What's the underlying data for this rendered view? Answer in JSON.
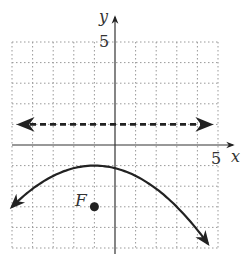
{
  "chart_data": {
    "type": "line",
    "title": "",
    "xlabel": "x",
    "ylabel": "y",
    "xlim": [
      -5,
      5
    ],
    "ylim": [
      -5,
      5
    ],
    "grid": true,
    "x_tick_labels": [
      {
        "value": 5,
        "label": "5"
      }
    ],
    "y_tick_labels": [
      {
        "value": 5,
        "label": "5"
      }
    ],
    "series": [
      {
        "name": "parabola",
        "style": "solid",
        "equation": "y = -(x+1)^2/8 - 1",
        "vertex": [
          -1,
          -1
        ],
        "x": [
          -5,
          -4,
          -3,
          -2,
          -1,
          0,
          1,
          2,
          3,
          4,
          4.5
        ],
        "y": [
          -3,
          -2.125,
          -1.5,
          -1.125,
          -1,
          -1.125,
          -1.5,
          -2.125,
          -3,
          -4.125,
          -4.78
        ]
      },
      {
        "name": "directrix",
        "style": "dashed",
        "equation": "y = 1",
        "x": [
          -5,
          5
        ],
        "y": [
          1,
          1
        ]
      }
    ],
    "points": [
      {
        "label": "F",
        "x": -1,
        "y": -3
      }
    ]
  },
  "labels": {
    "x_axis": "x",
    "y_axis": "y",
    "x_tick": "5",
    "y_tick": "5",
    "focus": "F"
  }
}
